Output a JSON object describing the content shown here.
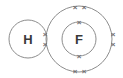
{
  "diagram": {
    "type": "dot-and-cross-diagram",
    "background_color": "#ffffff",
    "shell_stroke_color": "#8d8d8d",
    "label_color": "#3a3a3a",
    "electron_color": "#6e6e6e",
    "atoms": [
      {
        "id": "hydrogen",
        "symbol": "H",
        "center_x": 28,
        "center_y": 39,
        "shells": [
          {
            "id": "h-shell-1",
            "radius": 19
          }
        ]
      },
      {
        "id": "fluorine",
        "symbol": "F",
        "center_x": 79,
        "center_y": 39,
        "shells": [
          {
            "id": "f-shell-1",
            "radius": 17
          },
          {
            "id": "f-shell-2",
            "radius": 33
          }
        ]
      }
    ],
    "electrons": [
      {
        "id": "bonding-pair-upper",
        "glyph": "×",
        "x": 45,
        "y": 34,
        "shell": "overlap",
        "role": "bonding-pair"
      },
      {
        "id": "bonding-pair-lower",
        "glyph": "×",
        "x": 45,
        "y": 44,
        "shell": "overlap",
        "role": "bonding-pair"
      },
      {
        "id": "f-inner-top",
        "glyph": "×",
        "x": 79,
        "y": 22,
        "shell": "f-shell-1",
        "role": "inner-electron"
      },
      {
        "id": "f-inner-bottom",
        "glyph": "×",
        "x": 79,
        "y": 56,
        "shell": "f-shell-1",
        "role": "inner-electron"
      },
      {
        "id": "f-outer-top-left",
        "glyph": "×",
        "x": 75,
        "y": 7,
        "shell": "f-shell-2",
        "role": "lone-pair"
      },
      {
        "id": "f-outer-top-right",
        "glyph": "×",
        "x": 84,
        "y": 7,
        "shell": "f-shell-2",
        "role": "lone-pair"
      },
      {
        "id": "f-outer-bottom-left",
        "glyph": "×",
        "x": 75,
        "y": 71,
        "shell": "f-shell-2",
        "role": "lone-pair"
      },
      {
        "id": "f-outer-bottom-right",
        "glyph": "×",
        "x": 84,
        "y": 71,
        "shell": "f-shell-2",
        "role": "lone-pair"
      },
      {
        "id": "f-outer-right-upper",
        "glyph": "×",
        "x": 113,
        "y": 34,
        "shell": "f-shell-2",
        "role": "lone-pair"
      },
      {
        "id": "f-outer-right-lower",
        "glyph": "×",
        "x": 113,
        "y": 44,
        "shell": "f-shell-2",
        "role": "lone-pair"
      }
    ]
  }
}
